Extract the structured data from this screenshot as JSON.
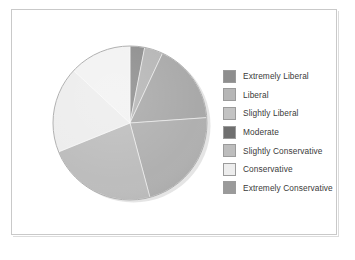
{
  "chart_data": {
    "type": "pie",
    "title": "",
    "subtitle": "",
    "xlabel": "",
    "ylabel": "",
    "grid": false,
    "legend_position": "right",
    "start_angle_deg": 0,
    "direction": "clockwise",
    "categories": [
      "Extremely Liberal",
      "Liberal",
      "Slightly Liberal",
      "Moderate",
      "Slightly Conservative",
      "Conservative",
      "Extremely Conservative"
    ],
    "values": [
      3,
      4,
      17,
      22,
      23,
      18,
      13
    ],
    "units": "percent",
    "colors": [
      "#8e8e8e",
      "#b6b6b6",
      "#a9a9a9",
      "#6f6f6f",
      "#bdbdbd",
      "#ededed",
      "#9a9a9a"
    ],
    "slices": [
      {
        "label": "Extremely Liberal",
        "value": 3,
        "color": "#8e8e8e",
        "start_deg": 0,
        "end_deg": 11
      },
      {
        "label": "Liberal",
        "value": 4,
        "color": "#b6b6b6",
        "start_deg": 11,
        "end_deg": 25
      },
      {
        "label": "Slightly Liberal",
        "value": 17,
        "color": "#a9a9a9",
        "start_deg": 25,
        "end_deg": 86
      },
      {
        "label": "Moderate",
        "value": 22,
        "color": "#b0b0b0",
        "start_deg": 86,
        "end_deg": 165
      },
      {
        "label": "Slightly Conservative",
        "value": 23,
        "color": "#bdbdbd",
        "start_deg": 165,
        "end_deg": 248
      },
      {
        "label": "Conservative",
        "value": 18,
        "color": "#ededed",
        "start_deg": 248,
        "end_deg": 313
      },
      {
        "label": "Extremely Conservative",
        "value": 13,
        "color": "#f2f2f2",
        "start_deg": 313,
        "end_deg": 360
      }
    ]
  },
  "legend": {
    "items": [
      {
        "label": "Extremely Liberal",
        "swatch": "#8e8e8e"
      },
      {
        "label": "Liberal",
        "swatch": "#b6b6b6"
      },
      {
        "label": "Slightly Liberal",
        "swatch": "#c3c3c3"
      },
      {
        "label": "Moderate",
        "swatch": "#6f6f6f"
      },
      {
        "label": "Slightly Conservative",
        "swatch": "#bdbdbd"
      },
      {
        "label": "Conservative",
        "swatch": "#ededed"
      },
      {
        "label": "Extremely Conservative",
        "swatch": "#9a9a9a"
      }
    ]
  },
  "figure": {
    "background": "#ffffff",
    "frame_color": "#c9c9c9"
  }
}
